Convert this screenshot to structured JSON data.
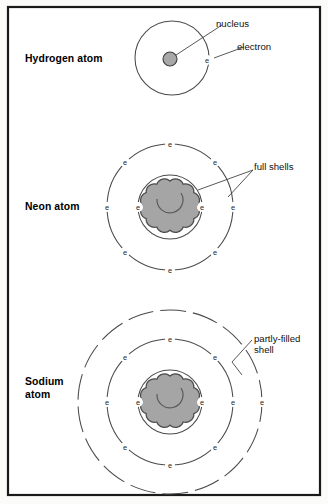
{
  "figure": {
    "background_color": "#fbfbfa",
    "frame_color": "#1a1a1a",
    "nucleus_fill": "#a5a5a5",
    "shell_stroke": "#4a4a4a",
    "electron_glyph": "e"
  },
  "atoms": [
    {
      "id": "hydrogen",
      "label": "Hydrogen atom",
      "nucleus_type": "single-circle",
      "shells": [
        {
          "name": "shell-1",
          "electron_count": 1,
          "style": "solid",
          "filled": true
        }
      ],
      "total_electrons": 1
    },
    {
      "id": "neon",
      "label": "Neon atom",
      "nucleus_type": "cloud",
      "shells": [
        {
          "name": "shell-1",
          "electron_count": 2,
          "style": "solid",
          "filled": true
        },
        {
          "name": "shell-2",
          "electron_count": 8,
          "style": "solid",
          "filled": true
        }
      ],
      "total_electrons": 10
    },
    {
      "id": "sodium",
      "label": "Sodium\natom",
      "nucleus_type": "cloud",
      "shells": [
        {
          "name": "shell-1",
          "electron_count": 2,
          "style": "solid",
          "filled": true
        },
        {
          "name": "shell-2",
          "electron_count": 8,
          "style": "solid",
          "filled": true
        },
        {
          "name": "shell-3",
          "electron_count": 1,
          "style": "dashed",
          "filled": false
        }
      ],
      "total_electrons": 11
    }
  ],
  "callouts": [
    {
      "id": "nucleus",
      "text": "nucleus",
      "target": "hydrogen-nucleus"
    },
    {
      "id": "electron",
      "text": "electron",
      "target": "hydrogen-electron"
    },
    {
      "id": "full-shells",
      "text": "full shells",
      "target": "neon-shells"
    },
    {
      "id": "partly-filled-shell",
      "text": "partly-filled\nshell",
      "target": "sodium-outer-shell"
    }
  ]
}
